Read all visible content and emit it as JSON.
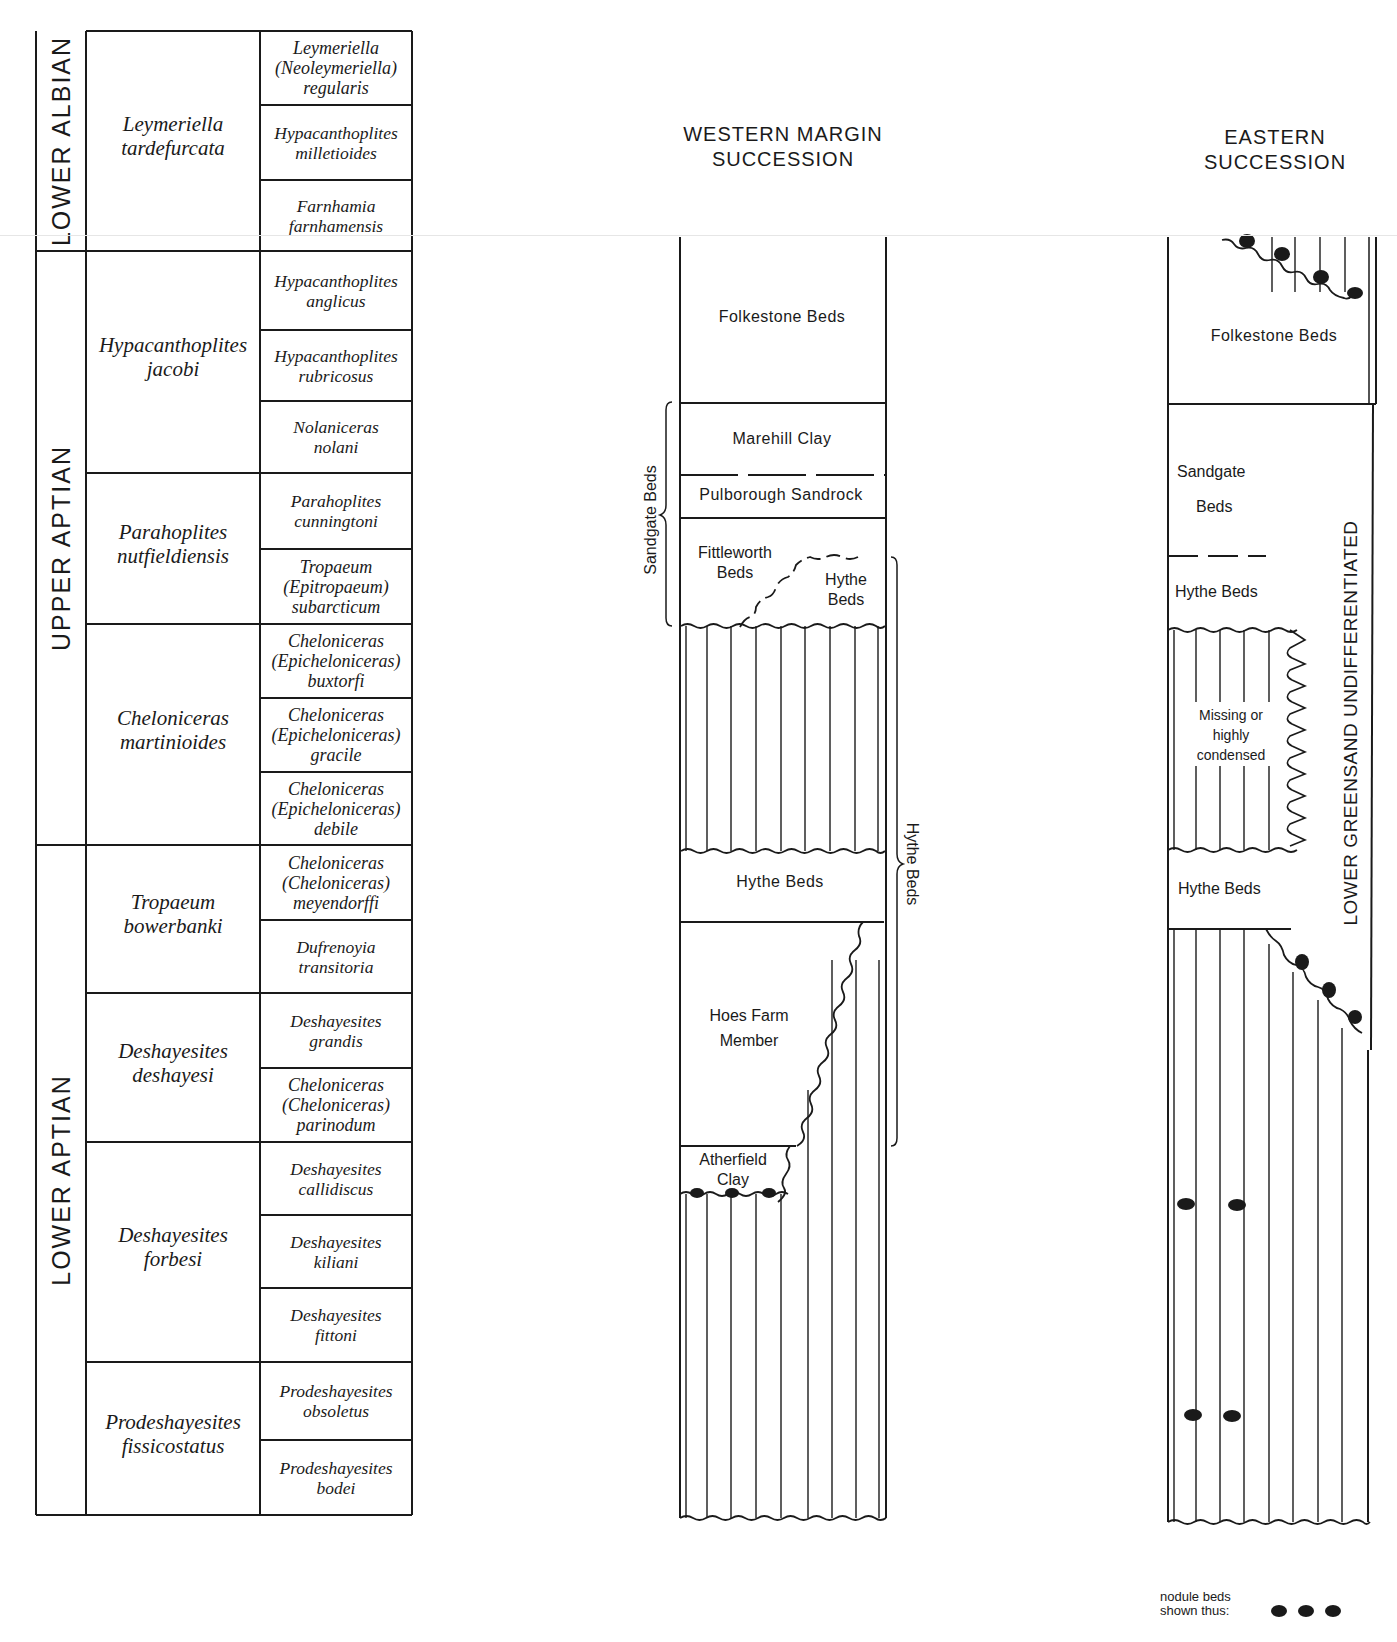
{
  "running_head": "GEOLOGY · CRETACEOUS: LOWER GREENSAND",
  "colors": {
    "ink": "#1a1a1a",
    "paper": "#ffffff",
    "faint_rule": "#e6e6e6"
  },
  "zone_table": {
    "stages": [
      {
        "label": "LOWER ALBIAN",
        "top": 31,
        "bottom": 251
      },
      {
        "label": "UPPER APTIAN",
        "top": 251,
        "bottom": 845
      },
      {
        "label": "LOWER APTIAN",
        "top": 845,
        "bottom": 1515
      }
    ],
    "zones": [
      {
        "name": [
          "Leymeriella",
          "tardefurcata"
        ],
        "top": 31,
        "bottom": 251
      },
      {
        "name": [
          "Hypacanthoplites",
          "jacobi"
        ],
        "top": 251,
        "bottom": 473
      },
      {
        "name": [
          "Parahoplites",
          "nutfieldiensis"
        ],
        "top": 473,
        "bottom": 624
      },
      {
        "name": [
          "Cheloniceras",
          "martinioides"
        ],
        "top": 624,
        "bottom": 845
      },
      {
        "name": [
          "Tropaeum",
          "bowerbanki"
        ],
        "top": 845,
        "bottom": 993
      },
      {
        "name": [
          "Deshayesites",
          "deshayesi"
        ],
        "top": 993,
        "bottom": 1142
      },
      {
        "name": [
          "Deshayesites",
          "forbesi"
        ],
        "top": 1142,
        "bottom": 1362
      },
      {
        "name": [
          "Prodeshayesites",
          "fissicostatus"
        ],
        "top": 1362,
        "bottom": 1515
      }
    ],
    "subzones": [
      {
        "name": [
          "Leymeriella",
          "(Neoleymeriella)",
          "regularis"
        ],
        "top": 31,
        "bottom": 105
      },
      {
        "name": [
          "Hypacanthoplites",
          "milletioides"
        ],
        "top": 105,
        "bottom": 180
      },
      {
        "name": [
          "Farnhamia",
          "farnhamensis"
        ],
        "top": 180,
        "bottom": 251
      },
      {
        "name": [
          "Hypacanthoplites",
          "anglicus"
        ],
        "top": 251,
        "bottom": 330
      },
      {
        "name": [
          "Hypacanthoplites",
          "rubricosus"
        ],
        "top": 330,
        "bottom": 401
      },
      {
        "name": [
          "Nolaniceras",
          "nolani"
        ],
        "top": 401,
        "bottom": 473
      },
      {
        "name": [
          "Parahoplites",
          "cunningtoni"
        ],
        "top": 473,
        "bottom": 549
      },
      {
        "name": [
          "Tropaeum",
          "(Epitropaeum)",
          "subarcticum"
        ],
        "top": 549,
        "bottom": 624
      },
      {
        "name": [
          "Cheloniceras",
          "(Epicheloniceras)",
          "buxtorfi"
        ],
        "top": 624,
        "bottom": 698
      },
      {
        "name": [
          "Cheloniceras",
          "(Epicheloniceras)",
          "gracile"
        ],
        "top": 698,
        "bottom": 772
      },
      {
        "name": [
          "Cheloniceras",
          "(Epicheloniceras)",
          "debile"
        ],
        "top": 772,
        "bottom": 845
      },
      {
        "name": [
          "Cheloniceras",
          "(Cheloniceras)",
          "meyendorffi"
        ],
        "top": 845,
        "bottom": 920
      },
      {
        "name": [
          "Dufrenoyia",
          "transitoria"
        ],
        "top": 920,
        "bottom": 993
      },
      {
        "name": [
          "Deshayesites",
          "grandis"
        ],
        "top": 993,
        "bottom": 1068
      },
      {
        "name": [
          "Cheloniceras",
          "(Cheloniceras)",
          "parinodum"
        ],
        "top": 1068,
        "bottom": 1142
      },
      {
        "name": [
          "Deshayesites",
          "callidiscus"
        ],
        "top": 1142,
        "bottom": 1215
      },
      {
        "name": [
          "Deshayesites",
          "kiliani"
        ],
        "top": 1215,
        "bottom": 1288
      },
      {
        "name": [
          "Deshayesites",
          "fittoni"
        ],
        "top": 1288,
        "bottom": 1362
      },
      {
        "name": [
          "Prodeshayesites",
          "obsoletus"
        ],
        "top": 1362,
        "bottom": 1440
      },
      {
        "name": [
          "Prodeshayesites",
          "bodei"
        ],
        "top": 1440,
        "bottom": 1515
      }
    ]
  },
  "western": {
    "title": [
      "WESTERN MARGIN",
      "SUCCESSION"
    ],
    "units": {
      "folkestone": "Folkestone Beds",
      "marehill": "Marehill Clay",
      "pulborough": "Pulborough Sandrock",
      "fittleworth": [
        "Fittleworth",
        "Beds"
      ],
      "hythe_upper": [
        "Hythe",
        "Beds"
      ],
      "hythe_mid": "Hythe Beds",
      "hoes_farm": [
        "Hoes Farm",
        "Member"
      ],
      "atherfield": [
        "Atherfield",
        "Clay"
      ]
    },
    "brackets": {
      "sandgate": "Sandgate Beds",
      "hythe": "Hythe Beds"
    }
  },
  "eastern": {
    "title": [
      "EASTERN",
      "SUCCESSION"
    ],
    "units": {
      "folkestone": "Folkestone Beds",
      "sandgate": [
        "Sandgate",
        "Beds"
      ],
      "hythe_upper": "Hythe Beds",
      "missing": [
        "Missing or",
        "highly",
        "condensed"
      ],
      "hythe_lower": "Hythe Beds"
    },
    "side_label": "LOWER GREENSAND UNDIFFERENTIATED"
  },
  "legend": {
    "text": [
      "nodule beds",
      "shown thus:"
    ],
    "icon": "nodule-dots-icon"
  }
}
